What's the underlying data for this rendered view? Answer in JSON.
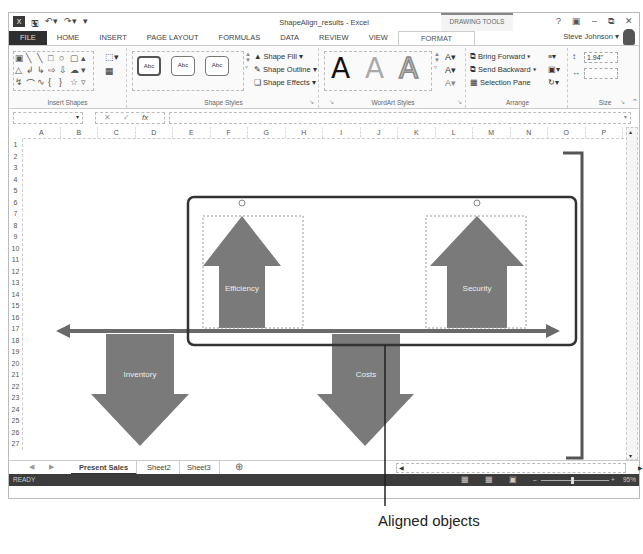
{
  "window": {
    "title": "ShapeAlign_results - Excel",
    "context_tab_group": "DRAWING TOOLS",
    "controls": [
      "?",
      "ribbon-display",
      "minimize",
      "restore",
      "close"
    ],
    "user": "Steve Johnson"
  },
  "quick_access": {
    "undo": "undo",
    "redo": "redo"
  },
  "tabs": [
    {
      "label": "FILE"
    },
    {
      "label": "HOME"
    },
    {
      "label": "INSERT"
    },
    {
      "label": "PAGE LAYOUT"
    },
    {
      "label": "FORMULAS"
    },
    {
      "label": "DATA"
    },
    {
      "label": "REVIEW"
    },
    {
      "label": "VIEW"
    },
    {
      "label": "FORMAT",
      "active": true
    }
  ],
  "ribbon": {
    "insert_shapes": {
      "label": "Insert Shapes"
    },
    "shape_styles": {
      "label": "Shape Styles",
      "presets": [
        "Abc",
        "Abc",
        "Abc"
      ],
      "shape_fill": "Shape Fill ▾",
      "shape_outline": "Shape Outline ▾",
      "shape_effects": "Shape Effects ▾"
    },
    "wordart_styles": {
      "label": "WordArt Styles",
      "samples": [
        "A",
        "A",
        "A"
      ]
    },
    "arrange": {
      "label": "Arrange",
      "bring_forward": "Bring Forward",
      "send_backward": "Send Backward",
      "selection_pane": "Selection Pane"
    },
    "size": {
      "label": "Size",
      "height": "1.94\"",
      "width": ""
    }
  },
  "formula_bar": {
    "name_box": "",
    "fx": "fx",
    "value": ""
  },
  "columns": [
    "A",
    "B",
    "C",
    "D",
    "E",
    "F",
    "G",
    "H",
    "I",
    "J",
    "K",
    "L",
    "M",
    "N",
    "O",
    "P"
  ],
  "rows": [
    "1",
    "2",
    "3",
    "4",
    "5",
    "6",
    "7",
    "8",
    "9",
    "10",
    "11",
    "12",
    "13",
    "14",
    "15",
    "16",
    "17",
    "18",
    "19",
    "20",
    "21",
    "22",
    "23",
    "24",
    "25",
    "26",
    "27"
  ],
  "shapes": {
    "up_arrows": [
      "Efficiency",
      "Security"
    ],
    "down_arrows": [
      "Inventory",
      "Costs"
    ]
  },
  "sheets": [
    {
      "label": "Present Sales",
      "active": true
    },
    {
      "label": "Sheet2"
    },
    {
      "label": "Sheet3"
    }
  ],
  "status": {
    "mode": "READY",
    "zoom": "95%"
  },
  "callout": "Aligned objects"
}
